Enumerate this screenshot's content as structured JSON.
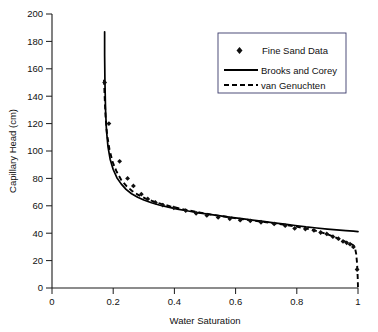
{
  "chart_data": {
    "type": "line",
    "title": "",
    "xlabel": "Water Saturation",
    "ylabel": "Capillary Head (cm)",
    "xlim": [
      0,
      1
    ],
    "ylim": [
      0,
      200
    ],
    "grid": false,
    "legend_position": "top-right",
    "xticks": [
      "0",
      "0.2",
      "0.4",
      "0.6",
      "0.8",
      "1"
    ],
    "xtick_values": [
      0,
      0.2,
      0.4,
      0.6,
      0.8,
      1
    ],
    "yticks": [
      "0",
      "20",
      "40",
      "60",
      "80",
      "100",
      "120",
      "140",
      "160",
      "180",
      "200"
    ],
    "ytick_values": [
      0,
      20,
      40,
      60,
      80,
      100,
      120,
      140,
      160,
      180,
      200
    ],
    "series": [
      {
        "name": "Fine Sand Data",
        "style": "markers",
        "marker": "diamond",
        "color": "#101010",
        "points": [
          [
            0.172,
            150.0
          ],
          [
            0.186,
            120.0
          ],
          [
            0.221,
            92.5
          ],
          [
            0.247,
            80.0
          ],
          [
            0.266,
            74.5
          ],
          [
            0.292,
            68.5
          ],
          [
            0.313,
            65.0
          ],
          [
            0.338,
            62.5
          ],
          [
            0.362,
            60.5
          ],
          [
            0.398,
            58.5
          ],
          [
            0.437,
            56.5
          ],
          [
            0.471,
            54.5
          ],
          [
            0.506,
            53.0
          ],
          [
            0.543,
            51.5
          ],
          [
            0.581,
            50.5
          ],
          [
            0.615,
            49.5
          ],
          [
            0.648,
            49.0
          ],
          [
            0.683,
            48.0
          ],
          [
            0.726,
            46.8
          ],
          [
            0.762,
            45.5
          ],
          [
            0.793,
            43.5
          ],
          [
            0.828,
            43.0
          ],
          [
            0.856,
            42.0
          ],
          [
            0.878,
            40.5
          ],
          [
            0.898,
            39.5
          ],
          [
            0.918,
            37.5
          ],
          [
            0.936,
            36.0
          ],
          [
            0.951,
            34.0
          ],
          [
            0.963,
            33.0
          ],
          [
            0.974,
            32.0
          ],
          [
            0.985,
            30.0
          ],
          [
            0.997,
            13.5
          ]
        ]
      },
      {
        "name": "Brooks and Corey",
        "style": "solid-line",
        "color": "#000000",
        "points": [
          [
            0.172,
            187.0
          ],
          [
            0.172,
            170.0
          ],
          [
            0.173,
            150.0
          ],
          [
            0.175,
            130.0
          ],
          [
            0.178,
            115.0
          ],
          [
            0.183,
            103.0
          ],
          [
            0.19,
            94.0
          ],
          [
            0.2,
            86.5
          ],
          [
            0.212,
            80.5
          ],
          [
            0.226,
            76.0
          ],
          [
            0.242,
            72.0
          ],
          [
            0.26,
            68.8
          ],
          [
            0.28,
            66.2
          ],
          [
            0.3,
            64.2
          ],
          [
            0.325,
            62.2
          ],
          [
            0.35,
            60.6
          ],
          [
            0.38,
            59.0
          ],
          [
            0.41,
            57.6
          ],
          [
            0.445,
            56.2
          ],
          [
            0.48,
            54.9
          ],
          [
            0.515,
            53.7
          ],
          [
            0.55,
            52.6
          ],
          [
            0.585,
            51.6
          ],
          [
            0.62,
            50.6
          ],
          [
            0.655,
            49.6
          ],
          [
            0.69,
            48.6
          ],
          [
            0.725,
            47.6
          ],
          [
            0.76,
            46.6
          ],
          [
            0.795,
            45.6
          ],
          [
            0.83,
            44.6
          ],
          [
            0.865,
            43.8
          ],
          [
            0.9,
            43.0
          ],
          [
            0.93,
            42.4
          ],
          [
            0.96,
            41.9
          ],
          [
            0.985,
            41.5
          ],
          [
            1.0,
            41.2
          ]
        ]
      },
      {
        "name": "van Genuchten",
        "style": "dashed-line",
        "color": "#000000",
        "points": [
          [
            0.17,
            152.0
          ],
          [
            0.172,
            140.0
          ],
          [
            0.175,
            125.0
          ],
          [
            0.18,
            112.0
          ],
          [
            0.188,
            101.0
          ],
          [
            0.198,
            92.0
          ],
          [
            0.211,
            85.0
          ],
          [
            0.226,
            79.0
          ],
          [
            0.243,
            74.5
          ],
          [
            0.262,
            70.8
          ],
          [
            0.283,
            67.8
          ],
          [
            0.305,
            65.4
          ],
          [
            0.33,
            63.3
          ],
          [
            0.357,
            61.4
          ],
          [
            0.387,
            59.6
          ],
          [
            0.418,
            58.0
          ],
          [
            0.45,
            56.5
          ],
          [
            0.485,
            55.0
          ],
          [
            0.52,
            53.6
          ],
          [
            0.556,
            52.4
          ],
          [
            0.592,
            51.2
          ],
          [
            0.628,
            50.1
          ],
          [
            0.664,
            49.0
          ],
          [
            0.7,
            48.0
          ],
          [
            0.736,
            46.9
          ],
          [
            0.77,
            45.8
          ],
          [
            0.802,
            44.6
          ],
          [
            0.832,
            43.3
          ],
          [
            0.858,
            42.0
          ],
          [
            0.88,
            40.6
          ],
          [
            0.9,
            39.2
          ],
          [
            0.918,
            37.7
          ],
          [
            0.934,
            36.2
          ],
          [
            0.948,
            34.8
          ],
          [
            0.96,
            33.6
          ],
          [
            0.97,
            32.7
          ],
          [
            0.978,
            32.0
          ],
          [
            0.985,
            31.2
          ],
          [
            0.99,
            29.5
          ],
          [
            0.994,
            25.0
          ],
          [
            0.997,
            18.0
          ],
          [
            0.999,
            8.0
          ],
          [
            1.0,
            0.5
          ]
        ]
      }
    ],
    "legend": [
      {
        "label": "Fine Sand Data",
        "marker": "diamond"
      },
      {
        "label": "Brooks and Corey",
        "marker": "solid-line"
      },
      {
        "label": "van Genuchten",
        "marker": "dashed-line"
      }
    ]
  }
}
